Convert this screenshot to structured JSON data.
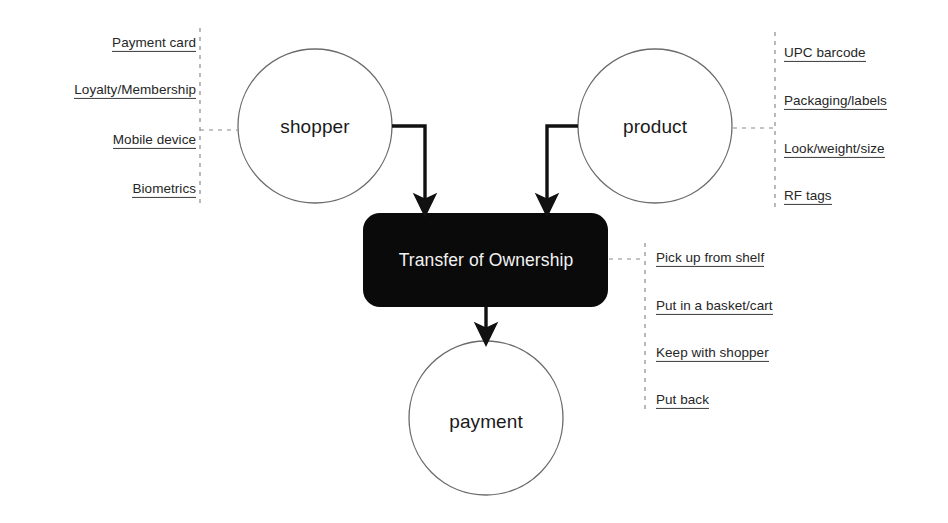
{
  "diagram": {
    "title": "Transfer of Ownership",
    "nodes": {
      "shopper": {
        "label": "shopper"
      },
      "product": {
        "label": "product"
      },
      "process": {
        "label": "Transfer of Ownership"
      },
      "payment": {
        "label": "payment"
      }
    },
    "annotations": {
      "shopper_attributes": [
        {
          "label": "Payment card"
        },
        {
          "label": "Loyalty/Membership"
        },
        {
          "label": "Mobile device"
        },
        {
          "label": "Biometrics"
        }
      ],
      "product_attributes": [
        {
          "label": "UPC barcode"
        },
        {
          "label": "Packaging/labels "
        },
        {
          "label": "Look/weight/size"
        },
        {
          "label": "RF tags"
        }
      ],
      "transfer_actions": [
        {
          "label": "Pick up from shelf"
        },
        {
          "label": "Put in a basket/cart"
        },
        {
          "label": "Keep with shopper"
        },
        {
          "label": "Put back"
        }
      ]
    },
    "colors": {
      "background": "#ffffff",
      "node_stroke": "#6b6b6b",
      "process_fill": "#0a0a0a",
      "process_text": "#f2f2f2",
      "arrow": "#111111",
      "dashed": "#8a8a8a",
      "text": "#262626"
    }
  }
}
